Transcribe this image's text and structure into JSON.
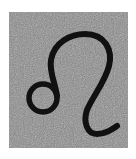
{
  "image": {
    "symbol": "leo-zodiac-symbol",
    "glyph": "♌",
    "colors": {
      "background": "#ffffff",
      "tile": "#8a8a8a",
      "noise_light": "#b0b0b0",
      "noise_dark": "#5e5e5e",
      "stroke": "#111111"
    }
  }
}
